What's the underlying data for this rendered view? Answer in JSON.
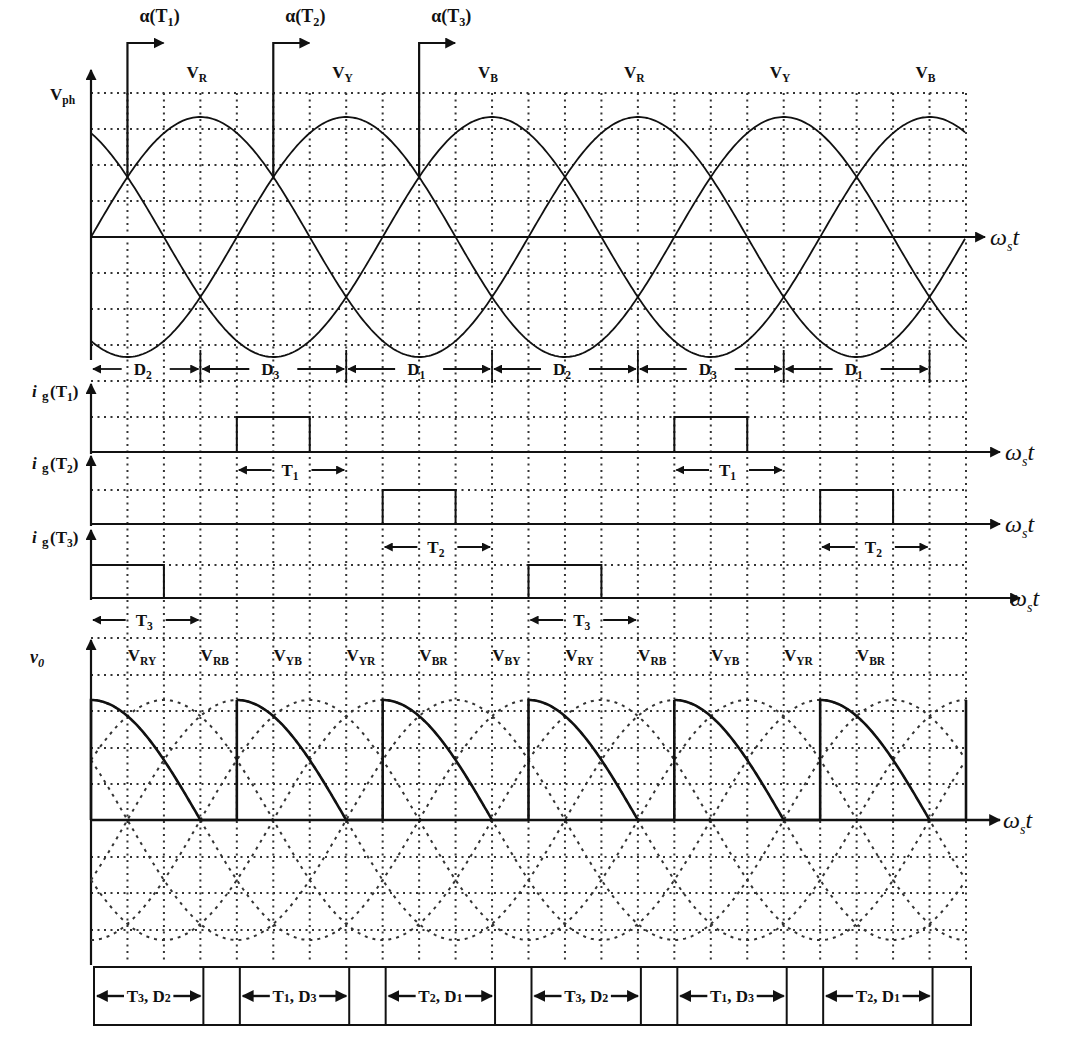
{
  "figure": {
    "axis_label_x": "ω",
    "axis_label_x_sub": "s",
    "axis_label_x_t": "t",
    "grid": {
      "x0": 91,
      "x1": 966,
      "columns": 24,
      "degrees_per_column": 30
    }
  },
  "phase_panel": {
    "y_label": "V",
    "y_label_sub": "ph",
    "phase_labels": [
      {
        "main": "V",
        "sub": "R",
        "col": 3
      },
      {
        "main": "V",
        "sub": "Y",
        "col": 7
      },
      {
        "main": "V",
        "sub": "B",
        "col": 11
      },
      {
        "main": "V",
        "sub": "R",
        "col": 15
      },
      {
        "main": "V",
        "sub": "Y",
        "col": 19
      },
      {
        "main": "V",
        "sub": "B",
        "col": 23
      }
    ],
    "firing_markers": [
      {
        "main": "α(T",
        "sub": "1",
        "close": ")",
        "col": 1
      },
      {
        "main": "α(T",
        "sub": "2",
        "close": ")",
        "col": 5
      },
      {
        "main": "α(T",
        "sub": "3",
        "close": ")",
        "col": 9
      }
    ],
    "diode_intervals": [
      {
        "main": "D",
        "sub": "2",
        "from": 0,
        "to": 3
      },
      {
        "main": "D",
        "sub": "3",
        "from": 3,
        "to": 7
      },
      {
        "main": "D",
        "sub": "1",
        "from": 7,
        "to": 11
      },
      {
        "main": "D",
        "sub": "2",
        "from": 11,
        "to": 15
      },
      {
        "main": "D",
        "sub": "3",
        "from": 15,
        "to": 19
      },
      {
        "main": "D",
        "sub": "1",
        "from": 19,
        "to": 23
      }
    ]
  },
  "gate_panels": [
    {
      "label_main": "i",
      "label_g": "g",
      "label_paren": "(T",
      "label_sub": "1",
      "label_close": ")",
      "pulses": [
        {
          "from": 4,
          "to": 6
        },
        {
          "from": 16,
          "to": 18
        }
      ],
      "intervals": [
        {
          "main": "T",
          "sub": "1",
          "from": 4,
          "to": 7
        },
        {
          "main": "T",
          "sub": "1",
          "from": 16,
          "to": 19
        }
      ]
    },
    {
      "label_main": "i",
      "label_g": "g",
      "label_paren": "(T",
      "label_sub": "2",
      "label_close": ")",
      "pulses": [
        {
          "from": 8,
          "to": 10
        },
        {
          "from": 20,
          "to": 22
        }
      ],
      "intervals": [
        {
          "main": "T",
          "sub": "2",
          "from": 8,
          "to": 11
        },
        {
          "main": "T",
          "sub": "2",
          "from": 20,
          "to": 23
        }
      ]
    },
    {
      "label_main": "i",
      "label_g": "g",
      "label_paren": "(T",
      "label_sub": "3",
      "label_close": ")",
      "pulses": [
        {
          "from": 0,
          "to": 2
        },
        {
          "from": 12,
          "to": 14
        }
      ],
      "intervals": [
        {
          "main": "T",
          "sub": "3",
          "from": 0,
          "to": 3
        },
        {
          "main": "T",
          "sub": "3",
          "from": 12,
          "to": 15
        }
      ]
    }
  ],
  "output_panel": {
    "y_label": "v",
    "y_label_sub": "0",
    "line_labels": [
      {
        "main": "V",
        "sub": "RY",
        "col": 1.5
      },
      {
        "main": "V",
        "sub": "RB",
        "col": 3.5
      },
      {
        "main": "V",
        "sub": "YB",
        "col": 5.5
      },
      {
        "main": "V",
        "sub": "YR",
        "col": 7.5
      },
      {
        "main": "V",
        "sub": "BR",
        "col": 9.5
      },
      {
        "main": "V",
        "sub": "BY",
        "col": 11.5
      },
      {
        "main": "V",
        "sub": "RY",
        "col": 13.5
      },
      {
        "main": "V",
        "sub": "RB",
        "col": 15.5
      },
      {
        "main": "V",
        "sub": "YB",
        "col": 17.5
      },
      {
        "main": "V",
        "sub": "YR",
        "col": 19.5
      },
      {
        "main": "V",
        "sub": "BR",
        "col": 21.5
      }
    ]
  },
  "conduction_table": {
    "cells": [
      {
        "from": 0,
        "to": 3,
        "text": "T",
        "t_sub": "3",
        "sep": ", ",
        "d": "D",
        "d_sub": "2"
      },
      {
        "from": 3,
        "to": 4,
        "text": ""
      },
      {
        "from": 4,
        "to": 7,
        "text": "T",
        "t_sub": "1",
        "sep": ", ",
        "d": "D",
        "d_sub": "3"
      },
      {
        "from": 7,
        "to": 8,
        "text": ""
      },
      {
        "from": 8,
        "to": 11,
        "text": "T",
        "t_sub": "2",
        "sep": ", ",
        "d": "D",
        "d_sub": "1"
      },
      {
        "from": 11,
        "to": 12,
        "text": ""
      },
      {
        "from": 12,
        "to": 15,
        "text": "T",
        "t_sub": "3",
        "sep": ", ",
        "d": "D",
        "d_sub": "2"
      },
      {
        "from": 15,
        "to": 16,
        "text": ""
      },
      {
        "from": 16,
        "to": 19,
        "text": "T",
        "t_sub": "1",
        "sep": ", ",
        "d": "D",
        "d_sub": "3"
      },
      {
        "from": 19,
        "to": 20,
        "text": ""
      },
      {
        "from": 20,
        "to": 23,
        "text": "T",
        "t_sub": "2",
        "sep": ", ",
        "d": "D",
        "d_sub": "1"
      },
      {
        "from": 23,
        "to": 24,
        "text": ""
      }
    ]
  },
  "colors": {
    "ink": "#111111",
    "grid": "#333333",
    "background": "#ffffff"
  }
}
